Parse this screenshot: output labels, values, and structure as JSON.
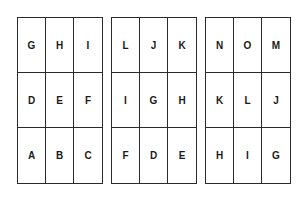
{
  "grids": [
    {
      "rows": [
        [
          "G",
          "H",
          "I"
        ],
        [
          "D",
          "E",
          "F"
        ],
        [
          "A",
          "B",
          "C"
        ]
      ]
    },
    {
      "rows": [
        [
          "L",
          "J",
          "K"
        ],
        [
          "I",
          "G",
          "H"
        ],
        [
          "F",
          "D",
          "E"
        ]
      ]
    },
    {
      "rows": [
        [
          "N",
          "O",
          "M"
        ],
        [
          "K",
          "L",
          "J"
        ],
        [
          "H",
          "I",
          "G"
        ]
      ]
    }
  ]
}
